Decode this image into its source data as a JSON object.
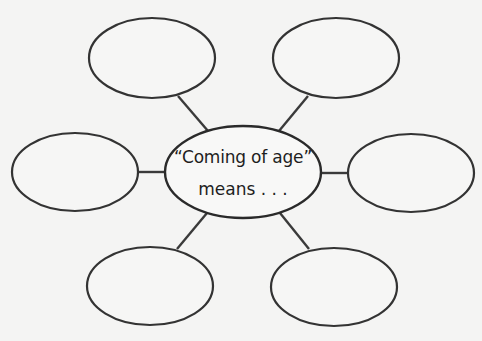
{
  "diagram": {
    "type": "concept-web",
    "center": {
      "line1": "“Coming of age”",
      "line2": "means . . .",
      "cx": 243,
      "cy": 172,
      "rx": 78,
      "ry": 46
    },
    "bubbles": [
      {
        "id": "top-left",
        "label": "",
        "cx": 152,
        "cy": 58,
        "rx": 63,
        "ry": 40
      },
      {
        "id": "top-right",
        "label": "",
        "cx": 336,
        "cy": 58,
        "rx": 63,
        "ry": 40
      },
      {
        "id": "left",
        "label": "",
        "cx": 75,
        "cy": 172,
        "rx": 63,
        "ry": 39
      },
      {
        "id": "right",
        "label": "",
        "cx": 411,
        "cy": 173,
        "rx": 63,
        "ry": 39
      },
      {
        "id": "bottom-left",
        "label": "",
        "cx": 150,
        "cy": 286,
        "rx": 63,
        "ry": 39
      },
      {
        "id": "bottom-right",
        "label": "",
        "cx": 334,
        "cy": 287,
        "rx": 63,
        "ry": 39
      }
    ],
    "connectors": [
      {
        "from": "center",
        "to": "top-left",
        "x1": 208,
        "y1": 131,
        "x2": 178,
        "y2": 96
      },
      {
        "from": "center",
        "to": "top-right",
        "x1": 279,
        "y1": 131,
        "x2": 308,
        "y2": 96
      },
      {
        "from": "center",
        "to": "left",
        "x1": 165,
        "y1": 172,
        "x2": 137,
        "y2": 172
      },
      {
        "from": "center",
        "to": "right",
        "x1": 321,
        "y1": 173,
        "x2": 348,
        "y2": 173
      },
      {
        "from": "center",
        "to": "bottom-left",
        "x1": 207,
        "y1": 213,
        "x2": 177,
        "y2": 249
      },
      {
        "from": "center",
        "to": "bottom-right",
        "x1": 280,
        "y1": 213,
        "x2": 309,
        "y2": 249
      }
    ],
    "colors": {
      "background": "#f4f4f3",
      "stroke": "#333333",
      "text": "#1e1e1e"
    }
  }
}
